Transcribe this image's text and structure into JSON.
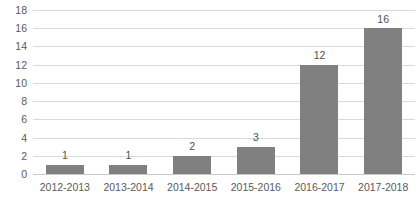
{
  "chart_data": {
    "type": "bar",
    "title": "",
    "subtitle": "",
    "xlabel": "",
    "ylabel": "",
    "categories": [
      "2012-2013",
      "2013-2014",
      "2014-2015",
      "2015-2016",
      "2016-2017",
      "2017-2018"
    ],
    "values": [
      1,
      1,
      2,
      3,
      12,
      16
    ],
    "data_labels": [
      "1",
      "1",
      "2",
      "3",
      "12",
      "16"
    ],
    "ylim": [
      0,
      18
    ],
    "ytick_step": 2,
    "yticks": [
      0,
      2,
      4,
      6,
      8,
      10,
      12,
      14,
      16,
      18
    ],
    "ytick_labels": [
      "0",
      "2",
      "4",
      "6",
      "8",
      "10",
      "12",
      "14",
      "16",
      "18"
    ],
    "grid": true,
    "grid_axis": "y",
    "legend": false,
    "legend_position": "none",
    "annotations": []
  },
  "style": {
    "background_color": "#ffffff",
    "bar_color": "#808080",
    "gridline_color": "#d9d9d9",
    "baseline_color": "#c8c8c8",
    "tick_label_color": "#5a5a5a",
    "data_label_color": "#4f4f4f"
  }
}
